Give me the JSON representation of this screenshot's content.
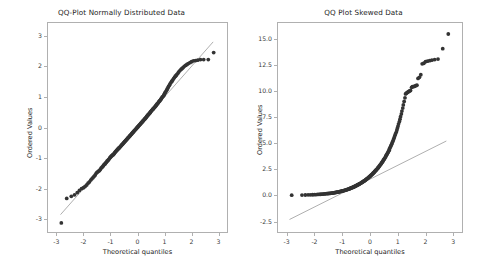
{
  "figure": {
    "width": 485,
    "height": 270,
    "background": "#ffffff",
    "marker_color": "#333333",
    "line_color": "#9a9a9a",
    "axis_color": "#b0b0b0"
  },
  "chart_data": [
    {
      "type": "scatter",
      "title": "QQ-Plot Normally Distributed Data",
      "xlabel": "Theoretical quantiles",
      "ylabel": "Ordered Values",
      "xlim": [
        -3.35,
        3.35
      ],
      "ylim": [
        -3.45,
        3.45
      ],
      "xticks": [
        -3,
        -2,
        -1,
        0,
        1,
        2,
        3
      ],
      "xticklabels": [
        "-3",
        "-2",
        "-1",
        "0",
        "1",
        "2",
        "3"
      ],
      "yticks": [
        3,
        2,
        1,
        0,
        -1,
        -2,
        -3
      ],
      "yticklabels": [
        "3",
        "2",
        "1",
        "0",
        "-1",
        "-2",
        "-3"
      ],
      "grid": false,
      "legend": null,
      "reference_line": {
        "slope": 1.0,
        "intercept": 0.0,
        "x_start": -2.85,
        "x_end": 2.8
      },
      "x": [
        -2.82,
        -2.62,
        -2.45,
        -2.33,
        -2.23,
        -2.15,
        -2.07,
        -2.0,
        -1.94,
        -1.88,
        -1.83,
        -1.78,
        -1.73,
        -1.69,
        -1.65,
        -1.61,
        -1.57,
        -1.53,
        -1.5,
        -1.46,
        -1.43,
        -1.4,
        -1.37,
        -1.34,
        -1.31,
        -1.28,
        -1.26,
        -1.23,
        -1.2,
        -1.18,
        -1.15,
        -1.13,
        -1.1,
        -1.08,
        -1.06,
        -1.03,
        -1.01,
        -0.99,
        -0.97,
        -0.95,
        -0.92,
        -0.9,
        -0.88,
        -0.86,
        -0.84,
        -0.82,
        -0.8,
        -0.78,
        -0.76,
        -0.74,
        -0.72,
        -0.7,
        -0.69,
        -0.67,
        -0.65,
        -0.63,
        -0.61,
        -0.59,
        -0.57,
        -0.56,
        -0.54,
        -0.52,
        -0.5,
        -0.48,
        -0.47,
        -0.45,
        -0.43,
        -0.41,
        -0.4,
        -0.38,
        -0.36,
        -0.34,
        -0.33,
        -0.31,
        -0.29,
        -0.28,
        -0.26,
        -0.24,
        -0.22,
        -0.21,
        -0.19,
        -0.17,
        -0.16,
        -0.14,
        -0.12,
        -0.11,
        -0.09,
        -0.07,
        -0.06,
        -0.04,
        -0.02,
        -0.01,
        0.01,
        0.02,
        0.04,
        0.06,
        0.07,
        0.09,
        0.11,
        0.12,
        0.14,
        0.16,
        0.17,
        0.19,
        0.21,
        0.22,
        0.24,
        0.26,
        0.28,
        0.29,
        0.31,
        0.33,
        0.34,
        0.36,
        0.38,
        0.4,
        0.41,
        0.43,
        0.45,
        0.47,
        0.48,
        0.5,
        0.52,
        0.54,
        0.56,
        0.57,
        0.59,
        0.61,
        0.63,
        0.65,
        0.67,
        0.69,
        0.7,
        0.72,
        0.74,
        0.76,
        0.78,
        0.8,
        0.82,
        0.84,
        0.86,
        0.88,
        0.9,
        0.92,
        0.95,
        0.97,
        0.99,
        1.01,
        1.03,
        1.06,
        1.08,
        1.1,
        1.13,
        1.15,
        1.18,
        1.2,
        1.23,
        1.26,
        1.28,
        1.31,
        1.34,
        1.37,
        1.4,
        1.43,
        1.46,
        1.5,
        1.53,
        1.57,
        1.61,
        1.65,
        1.69,
        1.73,
        1.78,
        1.83,
        1.88,
        1.94,
        2.0,
        2.07,
        2.15,
        2.23,
        2.33,
        2.45,
        2.62,
        2.82
      ],
      "y": [
        -3.12,
        -2.32,
        -2.25,
        -2.2,
        -2.13,
        -2.06,
        -2.0,
        -1.97,
        -1.93,
        -1.88,
        -1.82,
        -1.78,
        -1.72,
        -1.68,
        -1.64,
        -1.6,
        -1.56,
        -1.5,
        -1.47,
        -1.44,
        -1.42,
        -1.4,
        -1.36,
        -1.32,
        -1.3,
        -1.27,
        -1.24,
        -1.21,
        -1.19,
        -1.16,
        -1.14,
        -1.1,
        -1.08,
        -1.06,
        -1.04,
        -1.0,
        -0.98,
        -0.96,
        -0.94,
        -0.92,
        -0.9,
        -0.89,
        -0.87,
        -0.85,
        -0.82,
        -0.8,
        -0.78,
        -0.76,
        -0.74,
        -0.72,
        -0.7,
        -0.69,
        -0.67,
        -0.66,
        -0.64,
        -0.62,
        -0.6,
        -0.58,
        -0.56,
        -0.55,
        -0.53,
        -0.51,
        -0.49,
        -0.47,
        -0.46,
        -0.44,
        -0.42,
        -0.4,
        -0.39,
        -0.37,
        -0.35,
        -0.33,
        -0.32,
        -0.3,
        -0.28,
        -0.27,
        -0.25,
        -0.23,
        -0.21,
        -0.2,
        -0.18,
        -0.16,
        -0.15,
        -0.13,
        -0.11,
        -0.1,
        -0.08,
        -0.06,
        -0.05,
        -0.03,
        -0.01,
        0.0,
        0.02,
        0.03,
        0.05,
        0.07,
        0.08,
        0.1,
        0.12,
        0.13,
        0.15,
        0.17,
        0.18,
        0.2,
        0.22,
        0.23,
        0.25,
        0.27,
        0.29,
        0.3,
        0.32,
        0.34,
        0.36,
        0.38,
        0.4,
        0.42,
        0.43,
        0.45,
        0.47,
        0.49,
        0.51,
        0.53,
        0.55,
        0.57,
        0.59,
        0.6,
        0.62,
        0.64,
        0.66,
        0.68,
        0.7,
        0.72,
        0.74,
        0.76,
        0.78,
        0.8,
        0.83,
        0.85,
        0.87,
        0.89,
        0.92,
        0.94,
        0.97,
        1.0,
        1.02,
        1.05,
        1.08,
        1.12,
        1.15,
        1.19,
        1.22,
        1.26,
        1.3,
        1.34,
        1.38,
        1.42,
        1.46,
        1.5,
        1.52,
        1.56,
        1.6,
        1.64,
        1.68,
        1.7,
        1.74,
        1.78,
        1.82,
        1.86,
        1.9,
        1.93,
        1.96,
        2.0,
        2.03,
        2.06,
        2.09,
        2.12,
        2.15,
        2.18,
        2.19,
        2.2,
        2.22,
        2.22,
        2.22,
        2.45
      ]
    },
    {
      "type": "scatter",
      "title": "QQ Plot Skewed Data",
      "xlabel": "Theoretical quantiles",
      "ylabel": "Ordered Values",
      "xlim": [
        -3.35,
        3.35
      ],
      "ylim": [
        -3.6,
        16.6
      ],
      "xticks": [
        -3,
        -2,
        -1,
        0,
        1,
        2,
        3
      ],
      "xticklabels": [
        "-3",
        "-2",
        "-1",
        "0",
        "1",
        "2",
        "3"
      ],
      "yticks": [
        15.0,
        12.5,
        10.0,
        7.5,
        5.0,
        2.5,
        0.0,
        -2.5
      ],
      "yticklabels": [
        "15.0",
        "12.5",
        "10.0",
        "7.5",
        "5.0",
        "2.5",
        "0.0",
        "-2.5"
      ],
      "grid": false,
      "legend": null,
      "reference_line": {
        "slope": 1.33,
        "intercept": 1.55,
        "x_start": -2.9,
        "x_end": 2.75
      },
      "x": [
        -2.82,
        -2.45,
        -2.33,
        -2.23,
        -2.15,
        -2.07,
        -2.0,
        -1.94,
        -1.88,
        -1.83,
        -1.78,
        -1.73,
        -1.69,
        -1.65,
        -1.61,
        -1.57,
        -1.53,
        -1.5,
        -1.46,
        -1.43,
        -1.4,
        -1.37,
        -1.34,
        -1.31,
        -1.28,
        -1.26,
        -1.23,
        -1.2,
        -1.18,
        -1.15,
        -1.13,
        -1.1,
        -1.08,
        -1.06,
        -1.03,
        -1.01,
        -0.99,
        -0.97,
        -0.95,
        -0.92,
        -0.9,
        -0.88,
        -0.86,
        -0.84,
        -0.82,
        -0.8,
        -0.78,
        -0.76,
        -0.74,
        -0.72,
        -0.7,
        -0.69,
        -0.67,
        -0.65,
        -0.63,
        -0.61,
        -0.59,
        -0.57,
        -0.56,
        -0.54,
        -0.52,
        -0.5,
        -0.48,
        -0.47,
        -0.45,
        -0.43,
        -0.41,
        -0.4,
        -0.38,
        -0.36,
        -0.34,
        -0.33,
        -0.31,
        -0.29,
        -0.28,
        -0.26,
        -0.24,
        -0.22,
        -0.21,
        -0.19,
        -0.17,
        -0.16,
        -0.14,
        -0.12,
        -0.11,
        -0.09,
        -0.07,
        -0.06,
        -0.04,
        -0.02,
        -0.01,
        0.01,
        0.02,
        0.04,
        0.06,
        0.07,
        0.09,
        0.11,
        0.12,
        0.14,
        0.16,
        0.17,
        0.19,
        0.21,
        0.22,
        0.24,
        0.26,
        0.28,
        0.29,
        0.31,
        0.33,
        0.34,
        0.36,
        0.38,
        0.4,
        0.41,
        0.43,
        0.45,
        0.47,
        0.48,
        0.5,
        0.52,
        0.54,
        0.56,
        0.57,
        0.59,
        0.61,
        0.63,
        0.65,
        0.67,
        0.69,
        0.7,
        0.72,
        0.74,
        0.76,
        0.78,
        0.8,
        0.82,
        0.84,
        0.86,
        0.88,
        0.9,
        0.92,
        0.95,
        0.97,
        0.99,
        1.01,
        1.03,
        1.06,
        1.08,
        1.1,
        1.13,
        1.15,
        1.18,
        1.2,
        1.23,
        1.26,
        1.28,
        1.31,
        1.34,
        1.37,
        1.4,
        1.43,
        1.46,
        1.5,
        1.53,
        1.57,
        1.61,
        1.65,
        1.69,
        1.73,
        1.78,
        1.83,
        1.88,
        1.94,
        2.0,
        2.07,
        2.15,
        2.23,
        2.33,
        2.45,
        2.62,
        2.82
      ],
      "y": [
        0.02,
        0.03,
        0.04,
        0.05,
        0.05,
        0.06,
        0.07,
        0.08,
        0.09,
        0.1,
        0.11,
        0.12,
        0.13,
        0.14,
        0.15,
        0.16,
        0.17,
        0.18,
        0.19,
        0.2,
        0.21,
        0.22,
        0.23,
        0.25,
        0.26,
        0.27,
        0.28,
        0.3,
        0.31,
        0.32,
        0.34,
        0.35,
        0.37,
        0.38,
        0.4,
        0.41,
        0.43,
        0.44,
        0.46,
        0.48,
        0.49,
        0.51,
        0.53,
        0.55,
        0.56,
        0.58,
        0.6,
        0.62,
        0.64,
        0.66,
        0.68,
        0.7,
        0.72,
        0.74,
        0.76,
        0.78,
        0.81,
        0.83,
        0.85,
        0.87,
        0.9,
        0.92,
        0.95,
        0.97,
        1.0,
        1.02,
        1.05,
        1.07,
        1.1,
        1.13,
        1.16,
        1.18,
        1.21,
        1.24,
        1.27,
        1.3,
        1.33,
        1.36,
        1.39,
        1.42,
        1.46,
        1.49,
        1.52,
        1.56,
        1.59,
        1.63,
        1.66,
        1.7,
        1.74,
        1.78,
        1.81,
        1.85,
        1.89,
        1.93,
        1.97,
        2.02,
        2.06,
        2.1,
        2.15,
        2.19,
        2.24,
        2.29,
        2.34,
        2.39,
        2.44,
        2.49,
        2.54,
        2.6,
        2.65,
        2.71,
        2.77,
        2.83,
        2.89,
        2.95,
        3.02,
        3.08,
        3.15,
        3.22,
        3.29,
        3.37,
        3.44,
        3.52,
        3.6,
        3.68,
        3.77,
        3.85,
        3.94,
        4.03,
        4.13,
        4.23,
        4.33,
        4.44,
        4.55,
        4.66,
        4.78,
        4.9,
        5.03,
        5.16,
        5.3,
        5.44,
        5.59,
        5.75,
        5.91,
        6.08,
        6.26,
        6.45,
        6.64,
        6.85,
        7.07,
        7.3,
        7.54,
        7.8,
        8.07,
        8.36,
        8.66,
        8.99,
        9.34,
        9.71,
        9.78,
        9.84,
        9.9,
        9.95,
        10.0,
        10.05,
        10.35,
        10.4,
        10.42,
        10.45,
        10.5,
        10.55,
        11.2,
        11.3,
        11.55,
        12.6,
        12.65,
        12.8,
        12.85,
        12.9,
        12.95,
        13.0,
        13.05,
        14.05,
        15.45
      ]
    }
  ]
}
